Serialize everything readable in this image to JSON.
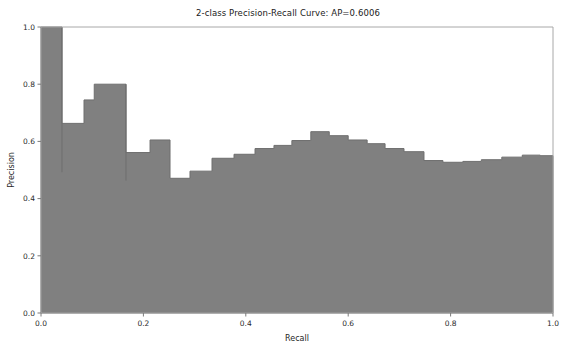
{
  "chart_data": {
    "type": "area",
    "title": "2-class Precision-Recall Curve: AP=0.6006",
    "xlabel": "Recall",
    "ylabel": "Precision",
    "xlim": [
      0.0,
      1.0
    ],
    "ylim": [
      0.0,
      1.0
    ],
    "xticks": [
      "0.0",
      "0.2",
      "0.4",
      "0.6",
      "0.8",
      "1.0"
    ],
    "xtick_values": [
      0.0,
      0.2,
      0.4,
      0.6,
      0.8,
      1.0
    ],
    "yticks": [
      "0.0",
      "0.2",
      "0.4",
      "0.6",
      "0.8",
      "1.0"
    ],
    "ytick_values": [
      0.0,
      0.2,
      0.4,
      0.6,
      0.8,
      1.0
    ],
    "grid": false,
    "legend": "none",
    "average_precision": 0.6006,
    "fill_color": "#808080",
    "line_color": "#6e6e6e",
    "step_mode": "post",
    "x": [
      0.0,
      0.041,
      0.084,
      0.104,
      0.166,
      0.213,
      0.252,
      0.291,
      0.334,
      0.377,
      0.418,
      0.455,
      0.49,
      0.527,
      0.563,
      0.6,
      0.637,
      0.672,
      0.709,
      0.748,
      0.785,
      0.824,
      0.86,
      0.9,
      0.94,
      0.975,
      1.0
    ],
    "y": [
      1.0,
      0.663,
      0.745,
      0.8,
      0.561,
      0.605,
      0.471,
      0.496,
      0.541,
      0.555,
      0.575,
      0.586,
      0.603,
      0.634,
      0.62,
      0.605,
      0.592,
      0.575,
      0.564,
      0.533,
      0.527,
      0.53,
      0.536,
      0.545,
      0.552,
      0.55,
      0.547
    ],
    "drop_lines": [
      {
        "x": 0.041,
        "y_top": 1.0,
        "y_bottom": 0.492
      },
      {
        "x": 0.166,
        "y_top": 0.8,
        "y_bottom": 0.463
      }
    ]
  }
}
